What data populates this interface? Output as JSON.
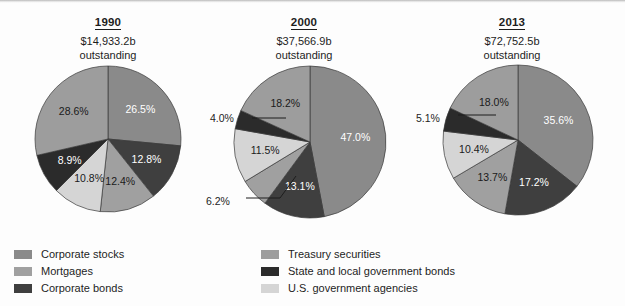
{
  "figure": {
    "width": 625,
    "height": 306,
    "background": "#fdfdfd"
  },
  "colors": {
    "corporate_stocks": "#8a8a8a",
    "mortgages": "#a0a0a0",
    "corporate_bonds": "#3f3f3f",
    "treasury_securities": "#9d9d9d",
    "state_local_bonds": "#2b2b2b",
    "us_government_agencies": "#d5d5d5",
    "slice_outline": "#3a3a3a",
    "text": "#1d1d1d",
    "label_light": "#ffffff"
  },
  "legend": {
    "left_column": [
      {
        "label": "Corporate stocks",
        "key": "corporate_stocks",
        "color": "#8a8a8a"
      },
      {
        "label": "Mortgages",
        "key": "mortgages",
        "color": "#a0a0a0"
      },
      {
        "label": "Corporate bonds",
        "key": "corporate_bonds",
        "color": "#3f3f3f"
      }
    ],
    "right_column": [
      {
        "label": "Treasury securities",
        "key": "treasury_securities",
        "color": "#9d9d9d"
      },
      {
        "label": "State and local government bonds",
        "key": "state_local_bonds",
        "color": "#2b2b2b"
      },
      {
        "label": "U.S. government agencies",
        "key": "us_government_agencies",
        "color": "#d5d5d5"
      }
    ]
  },
  "panels": [
    {
      "id": "1990",
      "year": "1990",
      "amount": "$14,933.2b",
      "outstanding": "outstanding"
    },
    {
      "id": "2000",
      "year": "2000",
      "amount": "$37,566.9b",
      "outstanding": "outstanding"
    },
    {
      "id": "2013",
      "year": "2013",
      "amount": "$72,752.5b",
      "outstanding": "outstanding"
    }
  ],
  "chart_data": [
    {
      "type": "pie",
      "title": "1990",
      "subtitle": "$14,933.2b outstanding",
      "total_outstanding": "$14,933.2b",
      "start_angle_deg": 0,
      "direction": "clockwise",
      "categories": [
        "Corporate stocks",
        "Corporate bonds",
        "Mortgages",
        "U.S. government agencies",
        "State and local government bonds",
        "Treasury securities"
      ],
      "values": [
        26.5,
        12.8,
        12.4,
        10.8,
        8.9,
        28.6
      ],
      "labels": [
        "26.5%",
        "12.8%",
        "12.4%",
        "10.8%",
        "8.9%",
        "28.6%"
      ],
      "label_placement": [
        "inside",
        "inside",
        "inside",
        "inside",
        "inside",
        "inside"
      ],
      "unit": "percent"
    },
    {
      "type": "pie",
      "title": "2000",
      "subtitle": "$37,566.9b outstanding",
      "total_outstanding": "$37,566.9b",
      "start_angle_deg": 0,
      "direction": "clockwise",
      "categories": [
        "Corporate stocks",
        "Corporate bonds",
        "Mortgages",
        "U.S. government agencies",
        "State and local government bonds",
        "Treasury securities"
      ],
      "values": [
        47.0,
        13.1,
        6.2,
        11.5,
        4.0,
        18.2
      ],
      "labels": [
        "47.0%",
        "13.1%",
        "6.2%",
        "11.5%",
        "4.0%",
        "18.2%"
      ],
      "label_placement": [
        "inside",
        "inside",
        "outside",
        "inside",
        "outside",
        "inside"
      ],
      "unit": "percent"
    },
    {
      "type": "pie",
      "title": "2013",
      "subtitle": "$72,752.5b outstanding",
      "total_outstanding": "$72,752.5b",
      "start_angle_deg": 0,
      "direction": "clockwise",
      "categories": [
        "Corporate stocks",
        "Corporate bonds",
        "Mortgages",
        "U.S. government agencies",
        "State and local government bonds",
        "Treasury securities"
      ],
      "values": [
        35.6,
        17.2,
        13.7,
        10.4,
        5.1,
        18.0
      ],
      "labels": [
        "35.6%",
        "17.2%",
        "13.7%",
        "10.4%",
        "5.1%",
        "18.0%"
      ],
      "label_placement": [
        "inside",
        "inside",
        "inside",
        "inside",
        "outside",
        "inside"
      ],
      "unit": "percent"
    }
  ]
}
